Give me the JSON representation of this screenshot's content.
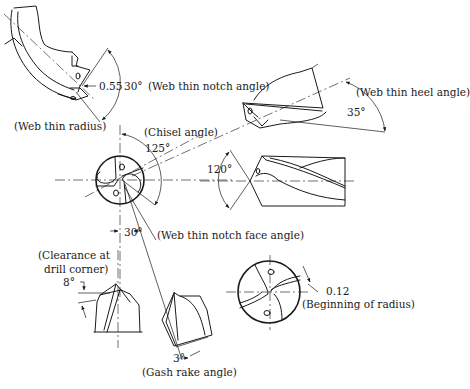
{
  "labels": {
    "web_thin_radius_value": "0.55",
    "web_thin_notch_angle_value": "30°",
    "web_thin_notch_angle": "(Web thin notch angle)",
    "web_thin_radius": "(Web thin radius)",
    "web_thin_heel_angle": "(Web thin heel angle)",
    "web_thin_heel_angle_value": "35°",
    "chisel_angle": "(Chisel angle)",
    "chisel_angle_value": "125°",
    "point_angle_value": "120°",
    "notch_face_angle_value": "30°",
    "web_thin_notch_face_angle": "(Web thin notch face angle)",
    "clearance_line1": "(Clearance at",
    "clearance_line2": "drill corner)",
    "clearance_value": "8°",
    "gash_rake_value": "3°",
    "gash_rake_angle": "(Gash rake angle)",
    "beginning_of_radius_value": "0.12",
    "beginning_of_radius": "(Beginning of radius)"
  },
  "colors": {
    "line": "#1a1a1a",
    "background": "#ffffff"
  }
}
